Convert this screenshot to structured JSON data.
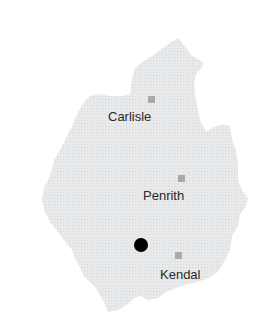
{
  "map": {
    "region_fill": "#e6e8ea",
    "town_marker_color": "#a7a9ab",
    "location_marker_color": "#000000",
    "towns": [
      {
        "name": "Carlisle",
        "marker": {
          "x": 148,
          "y": 96
        },
        "label_pos": {
          "x": 108,
          "y": 110
        }
      },
      {
        "name": "Penrith",
        "marker": {
          "x": 178,
          "y": 175
        },
        "label_pos": {
          "x": 143,
          "y": 189
        }
      },
      {
        "name": "Kendal",
        "marker": {
          "x": 175,
          "y": 252
        },
        "label_pos": {
          "x": 160,
          "y": 268
        }
      }
    ],
    "location_marker": {
      "x": 134,
      "y": 238
    }
  }
}
